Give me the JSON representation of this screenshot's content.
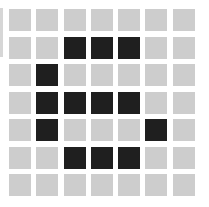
{
  "board": {
    "rows": 7,
    "cols": 7,
    "colors": {
      "off": "#cdcdcd",
      "on": "#1f1f1f",
      "background": "#ffffff"
    },
    "cells": [
      [
        0,
        0,
        0,
        0,
        0,
        0,
        0
      ],
      [
        0,
        0,
        1,
        1,
        1,
        0,
        0
      ],
      [
        0,
        1,
        0,
        0,
        0,
        0,
        0
      ],
      [
        0,
        1,
        1,
        1,
        1,
        0,
        0
      ],
      [
        0,
        1,
        0,
        0,
        0,
        1,
        0
      ],
      [
        0,
        0,
        1,
        1,
        1,
        0,
        0
      ],
      [
        0,
        0,
        0,
        0,
        0,
        0,
        0
      ]
    ]
  }
}
